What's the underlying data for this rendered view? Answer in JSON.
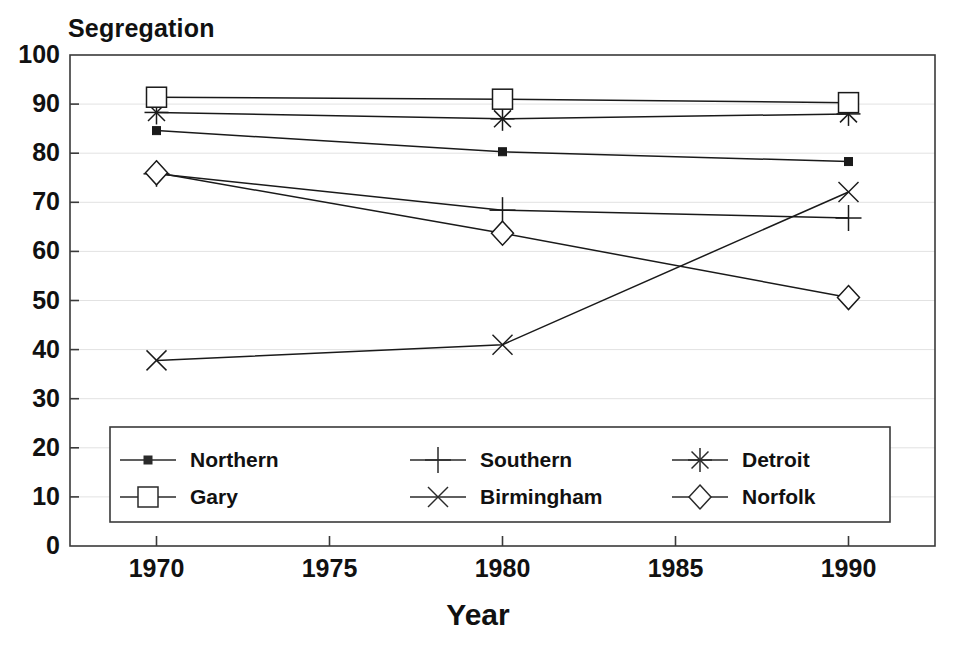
{
  "chart_data": {
    "type": "line",
    "title": "Segregation",
    "xlabel": "Year",
    "ylabel": "Segregation",
    "x": [
      1970,
      1980,
      1990
    ],
    "xlim": [
      1967.5,
      1992.5
    ],
    "ylim": [
      0,
      100
    ],
    "xticks": [
      1970,
      1975,
      1980,
      1985,
      1990
    ],
    "xtick_labels": [
      "1970",
      "1975",
      "1980",
      "1985",
      "1990"
    ],
    "yticks": [
      0,
      10,
      20,
      30,
      40,
      50,
      60,
      70,
      80,
      90,
      100
    ],
    "ytick_labels": [
      "0",
      "10",
      "20",
      "30",
      "40",
      "50",
      "60",
      "70",
      "80",
      "90",
      "100"
    ],
    "grid": "horizontal",
    "legend_position": "inside-bottom-center",
    "series": [
      {
        "name": "Northern",
        "marker": "filled-square",
        "color": "#1a1a1a",
        "values": [
          84.6,
          80.3,
          78.3
        ]
      },
      {
        "name": "Southern",
        "marker": "plus",
        "color": "#1a1a1a",
        "values": [
          75.8,
          68.4,
          66.8
        ]
      },
      {
        "name": "Detroit",
        "marker": "asterisk",
        "color": "#1a1a1a",
        "values": [
          88.3,
          87.0,
          88.0
        ]
      },
      {
        "name": "Gary",
        "marker": "open-square",
        "color": "#1a1a1a",
        "values": [
          91.4,
          91.0,
          90.3
        ]
      },
      {
        "name": "Birmingham",
        "marker": "cross-x",
        "color": "#1a1a1a",
        "values": [
          37.8,
          41.0,
          72.1
        ]
      },
      {
        "name": "Norfolk",
        "marker": "open-diamond",
        "color": "#1a1a1a",
        "values": [
          76.0,
          63.7,
          50.6
        ]
      }
    ]
  },
  "legend": {
    "entries": [
      {
        "label": "Northern",
        "marker": "filled-square"
      },
      {
        "label": "Southern",
        "marker": "plus"
      },
      {
        "label": "Detroit",
        "marker": "asterisk"
      },
      {
        "label": "Gary",
        "marker": "open-square"
      },
      {
        "label": "Birmingham",
        "marker": "cross-x"
      },
      {
        "label": "Norfolk",
        "marker": "open-diamond"
      }
    ]
  },
  "style": {
    "axis_color": "#3a3a3a",
    "grid_color": "#e2e2e2",
    "line_color": "#2a2a2a",
    "background": "#ffffff"
  }
}
